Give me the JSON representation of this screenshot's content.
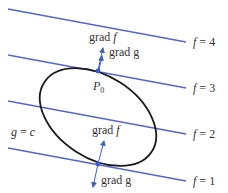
{
  "figure": {
    "level_curves": [
      {
        "label": "f = 4",
        "name": "f",
        "value": "4"
      },
      {
        "label": "f = 3",
        "name": "f",
        "value": "3"
      },
      {
        "label": "f = 2",
        "name": "f",
        "value": "2"
      },
      {
        "label": "f = 1",
        "name": "f",
        "value": "1"
      }
    ],
    "constraint_label": {
      "lhs": "g",
      "eq": "=",
      "rhs": "c"
    },
    "point_label": {
      "main": "P",
      "sub": "0"
    },
    "top_vectors": {
      "grad_f": "grad",
      "grad_f_var": "f",
      "grad_g": "grad g"
    },
    "bottom_vectors": {
      "grad_f": "grad",
      "grad_f_var": "f",
      "grad_g": "grad g"
    },
    "colors": {
      "level_line": "#5566cc",
      "curve": "#1a1a1a",
      "vector": "#4060c0",
      "point": "#3a5ccc",
      "text": "#333333"
    }
  }
}
